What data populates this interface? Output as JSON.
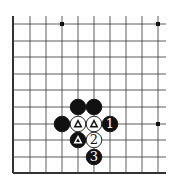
{
  "diagram": {
    "type": "go-board-fragment",
    "colors": {
      "background": "#ffffff",
      "line": "#333333",
      "black_stone": "#111111",
      "white_stone": "#ffffff"
    },
    "grid": {
      "columns_x": [
        13,
        30,
        46,
        62,
        78,
        94,
        110,
        126,
        142,
        158
      ],
      "rows_y": [
        24,
        41,
        57,
        74,
        90,
        107,
        124,
        140,
        157,
        173
      ],
      "top_extent": 16,
      "right_extent": 166,
      "border_left": true,
      "border_bottom": true
    },
    "star_points": [
      {
        "col": 3,
        "row": 0
      },
      {
        "col": 9,
        "row": 0
      },
      {
        "col": 9,
        "row": 6
      }
    ],
    "stones": [
      {
        "color": "black",
        "col": 4,
        "row": 5,
        "label": ""
      },
      {
        "color": "black",
        "col": 5,
        "row": 5,
        "label": ""
      },
      {
        "color": "black",
        "col": 3,
        "row": 6,
        "label": ""
      },
      {
        "color": "white",
        "col": 4,
        "row": 6,
        "label": "△"
      },
      {
        "color": "white",
        "col": 5,
        "row": 6,
        "label": "△"
      },
      {
        "color": "black",
        "col": 6,
        "row": 6,
        "label": "1"
      },
      {
        "color": "black",
        "col": 4,
        "row": 7,
        "label": "△"
      },
      {
        "color": "white",
        "col": 5,
        "row": 7,
        "label": "2"
      },
      {
        "color": "black",
        "col": 5,
        "row": 8,
        "label": "3"
      }
    ]
  }
}
